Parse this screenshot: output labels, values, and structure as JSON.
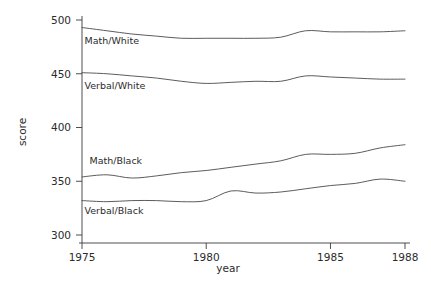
{
  "chart_data": {
    "type": "line",
    "title": "",
    "xlabel": "year",
    "ylabel": "score",
    "xlim": [
      1975,
      1988
    ],
    "ylim": [
      300,
      500
    ],
    "grid": false,
    "legend_position": "inline-labels",
    "x_ticks": [
      "1975",
      "1980",
      "1985",
      "1988"
    ],
    "x_tick_values": [
      1975,
      1980,
      1985,
      1988
    ],
    "y_ticks": [
      "300",
      "350",
      "400",
      "450",
      "500"
    ],
    "y_tick_values": [
      300,
      350,
      400,
      450,
      500
    ],
    "x": [
      1975,
      1976,
      1977,
      1978,
      1979,
      1980,
      1981,
      1982,
      1983,
      1984,
      1985,
      1986,
      1987,
      1988
    ],
    "series": [
      {
        "name": "Math/White",
        "label": "Math/White",
        "values": [
          493,
          490,
          487,
          485,
          483,
          483,
          483,
          483,
          484,
          490,
          489,
          489,
          489,
          490
        ]
      },
      {
        "name": "Verbal/White",
        "label": "Verbal/White",
        "values": [
          451,
          450,
          448,
          446,
          443,
          441,
          442,
          443,
          443,
          448,
          447,
          446,
          445,
          445
        ]
      },
      {
        "name": "Math/Black",
        "label": "Math/Black",
        "values": [
          354,
          356,
          353,
          355,
          358,
          360,
          363,
          366,
          369,
          375,
          375,
          376,
          381,
          384
        ]
      },
      {
        "name": "Verbal/Black",
        "label": "Verbal/Black",
        "values": [
          332,
          331,
          332,
          332,
          331,
          332,
          341,
          339,
          340,
          343,
          346,
          348,
          352,
          350
        ]
      }
    ],
    "series_label_anchors": [
      {
        "name": "Math/White",
        "x": 1975.1,
        "y": 478
      },
      {
        "name": "Verbal/White",
        "x": 1975.1,
        "y": 436
      },
      {
        "name": "Math/Black",
        "x": 1975.3,
        "y": 366
      },
      {
        "name": "Verbal/Black",
        "x": 1975.1,
        "y": 320
      }
    ],
    "colors": {
      "line": "#4a4a4a",
      "axis": "#3a3a3a",
      "text": "#2b2b2b",
      "background": "#ffffff"
    }
  }
}
